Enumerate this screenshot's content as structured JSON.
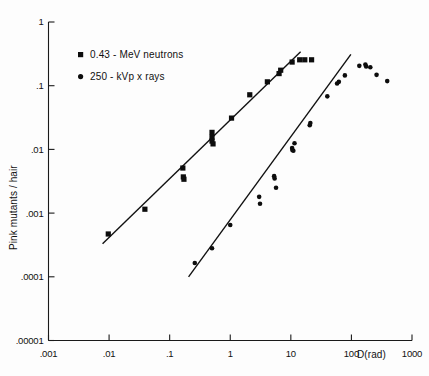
{
  "chart_data": {
    "type": "scatter",
    "title": "",
    "xlabel": "D(rad)",
    "ylabel": "Pink mutants / hair",
    "xscale": "log",
    "yscale": "log",
    "xlim": [
      0.001,
      1000
    ],
    "ylim": [
      1e-05,
      1
    ],
    "grid": false,
    "legend_position": "top-left",
    "xticks": [
      {
        "value": 0.001,
        "label": ".001"
      },
      {
        "value": 0.01,
        "label": ".01"
      },
      {
        "value": 0.1,
        "label": ".1"
      },
      {
        "value": 1,
        "label": "1"
      },
      {
        "value": 10,
        "label": "10"
      },
      {
        "value": 100,
        "label": "100"
      },
      {
        "value": 1000,
        "label": "1000"
      }
    ],
    "yticks": [
      {
        "value": 1,
        "label": "1"
      },
      {
        "value": 0.1,
        "label": ".1"
      },
      {
        "value": 0.01,
        "label": ".01"
      },
      {
        "value": 0.001,
        "label": ".001"
      },
      {
        "value": 0.0001,
        "label": ".0001"
      },
      {
        "value": 1e-05,
        "label": ".00001"
      }
    ],
    "series": [
      {
        "name": "0.43 - MeV neutrons",
        "marker": "square",
        "marker_size": 5.2,
        "color": "#0d0d0d",
        "points": [
          [
            0.0097,
            0.00047
          ],
          [
            0.039,
            0.00115
          ],
          [
            0.165,
            0.0051
          ],
          [
            0.168,
            0.0037
          ],
          [
            0.172,
            0.0034
          ],
          [
            0.5,
            0.0185
          ],
          [
            0.5,
            0.0155
          ],
          [
            0.5,
            0.0135
          ],
          [
            0.52,
            0.0122
          ],
          [
            1.05,
            0.031
          ],
          [
            2.1,
            0.072
          ],
          [
            4.1,
            0.115
          ],
          [
            6.4,
            0.155
          ],
          [
            6.8,
            0.175
          ],
          [
            10.5,
            0.235
          ],
          [
            14.0,
            0.255
          ],
          [
            17.0,
            0.255
          ],
          [
            22.0,
            0.255
          ]
        ],
        "fit_line": {
          "x0": 0.0078,
          "y0": 0.00033,
          "x1": 14.5,
          "y1": 0.34,
          "slope": 0.938
        }
      },
      {
        "name": "250 - kVp x rays",
        "marker": "circle",
        "marker_size": 4.6,
        "color": "#0d0d0d",
        "points": [
          [
            0.26,
            0.000165
          ],
          [
            0.5,
            0.00028
          ],
          [
            1.0,
            0.00065
          ],
          [
            3.0,
            0.0018
          ],
          [
            3.1,
            0.0014
          ],
          [
            5.3,
            0.0038
          ],
          [
            5.4,
            0.0035
          ],
          [
            5.7,
            0.0025
          ],
          [
            10.5,
            0.0105
          ],
          [
            10.6,
            0.0098
          ],
          [
            11.0,
            0.0095
          ],
          [
            11.5,
            0.0125
          ],
          [
            20.5,
            0.024
          ],
          [
            21.0,
            0.026
          ],
          [
            40.0,
            0.068
          ],
          [
            58.0,
            0.108
          ],
          [
            62.0,
            0.115
          ],
          [
            78.0,
            0.145
          ],
          [
            135.0,
            0.205
          ],
          [
            170.0,
            0.215
          ],
          [
            175.0,
            0.2
          ],
          [
            205.0,
            0.195
          ],
          [
            260.0,
            0.148
          ],
          [
            390.0,
            0.118
          ]
        ],
        "fit_line": {
          "x0": 0.205,
          "y0": 0.0001,
          "x1": 98.0,
          "y1": 0.31,
          "slope": 1.31
        }
      }
    ],
    "annotations": []
  },
  "legend": {
    "entries": [
      {
        "label": "0.43 - MeV neutrons",
        "marker": "square"
      },
      {
        "label": "250 - kVp x rays",
        "marker": "circle"
      }
    ]
  }
}
